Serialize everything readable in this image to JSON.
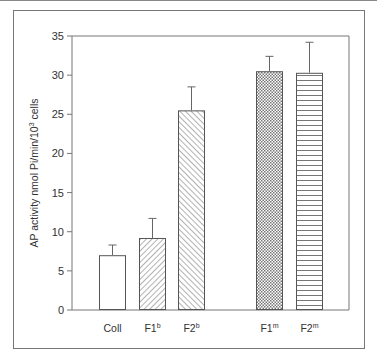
{
  "chart_data": {
    "type": "bar",
    "title": "",
    "xlabel": "",
    "ylabel": "AP activity  nmol Pi/min/10^3 cells",
    "ylabel_parts": {
      "main": "AP activity  nmol Pi/min/10",
      "sup": "3",
      "tail": " cells"
    },
    "ylim": [
      0,
      35
    ],
    "yticks": [
      0,
      5,
      10,
      15,
      20,
      25,
      30,
      35
    ],
    "grid": false,
    "legend": null,
    "categories": [
      {
        "base": "Coll",
        "sup": ""
      },
      {
        "base": "F1",
        "sup": "b"
      },
      {
        "base": "F2",
        "sup": "b"
      },
      {
        "base": "F1",
        "sup": "m"
      },
      {
        "base": "F2",
        "sup": "m"
      }
    ],
    "category_labels": [
      "Coll",
      "F1b",
      "F2b",
      "F1m",
      "F2m"
    ],
    "values": [
      7.0,
      9.2,
      25.5,
      30.5,
      30.3
    ],
    "error_upper": [
      8.3,
      11.7,
      28.5,
      32.4,
      34.2
    ],
    "fill_patterns": [
      "none",
      "diagonal-forward",
      "diagonal-back",
      "crosshatch",
      "horizontal"
    ]
  },
  "colors": {
    "axis": "#777777",
    "bar_edge": "#555555",
    "hatch": "#666666",
    "text": "#333333"
  }
}
